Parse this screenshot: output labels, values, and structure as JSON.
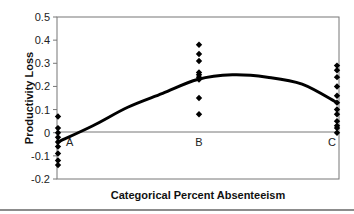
{
  "chart_data": {
    "type": "scatter",
    "title": "",
    "xlabel": "Categorical Percent Absenteeism",
    "ylabel": "Productivity Loss",
    "categories": [
      "A",
      "B",
      "C"
    ],
    "ylim": [
      -0.2,
      0.5
    ],
    "yticks": [
      "0.5",
      "0.4",
      "0.3",
      "0.2",
      "0.1",
      "0",
      "-0.1",
      "-0.2"
    ],
    "ytick_values": [
      0.5,
      0.4,
      0.3,
      0.2,
      0.1,
      0,
      -0.1,
      -0.2
    ],
    "grid": false,
    "zero_line": true,
    "legend": null,
    "series": [
      {
        "name": "observations",
        "kind": "points",
        "marker": "diamond",
        "points": {
          "A": [
            0.07,
            0.02,
            0.0,
            -0.02,
            -0.04,
            -0.06,
            -0.09,
            -0.12,
            -0.14
          ],
          "B": [
            0.38,
            0.34,
            0.31,
            0.26,
            0.25,
            0.24,
            0.23,
            0.15,
            0.08
          ],
          "C": [
            0.29,
            0.27,
            0.24,
            0.2,
            0.16,
            0.13,
            0.1,
            0.08,
            0.05,
            0.03,
            0.02,
            0.0
          ]
        }
      },
      {
        "name": "fitted curve",
        "kind": "line",
        "x": [
          0,
          0.25,
          0.5,
          0.75,
          1.0,
          1.25,
          1.5,
          1.75,
          2.0
        ],
        "values": [
          -0.04,
          0.03,
          0.11,
          0.17,
          0.23,
          0.25,
          0.24,
          0.21,
          0.13
        ]
      }
    ]
  }
}
